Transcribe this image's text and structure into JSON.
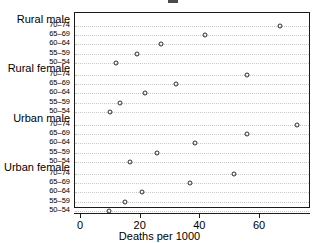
{
  "chart_data": {
    "type": "scatter",
    "plot_style": "cleveland-dot-plot",
    "title": "",
    "xlabel": "Deaths per 1000",
    "ylabel": "",
    "xlim": [
      0,
      77
    ],
    "xticks": [
      0,
      20,
      40,
      60
    ],
    "xtick_labels": [
      "0",
      "20",
      "40",
      "60"
    ],
    "grid": "horizontal-dotted",
    "legend": "none",
    "marker": "open-circle",
    "group_order": [
      "Rural male",
      "Rural female",
      "Urban male",
      "Urban female"
    ],
    "age_bands": [
      "70–74",
      "65–69",
      "60–64",
      "55–59",
      "50–54"
    ],
    "groups": [
      {
        "name": "Rural male",
        "points": [
          {
            "age": "70–74",
            "value": 66.7
          },
          {
            "age": "65–69",
            "value": 41.6
          },
          {
            "age": "60–64",
            "value": 26.8
          },
          {
            "age": "55–59",
            "value": 18.7
          },
          {
            "age": "50–54",
            "value": 11.6
          }
        ]
      },
      {
        "name": "Rural female",
        "points": [
          {
            "age": "70–74",
            "value": 55.6
          },
          {
            "age": "65–69",
            "value": 31.9
          },
          {
            "age": "60–64",
            "value": 21.5
          },
          {
            "age": "55–59",
            "value": 13.1
          },
          {
            "age": "50–54",
            "value": 9.8
          }
        ]
      },
      {
        "name": "Urban male",
        "points": [
          {
            "age": "70–74",
            "value": 72.4
          },
          {
            "age": "65–69",
            "value": 55.6
          },
          {
            "age": "60–64",
            "value": 38.2
          },
          {
            "age": "55–59",
            "value": 25.5
          },
          {
            "age": "50–54",
            "value": 16.4
          }
        ]
      },
      {
        "name": "Urban female",
        "points": [
          {
            "age": "70–74",
            "value": 51.3
          },
          {
            "age": "65–69",
            "value": 36.5
          },
          {
            "age": "60–64",
            "value": 20.5
          },
          {
            "age": "55–59",
            "value": 14.8
          },
          {
            "age": "50–54",
            "value": 9.4
          }
        ]
      }
    ],
    "colors": {
      "marker_stroke": "#2b2b2b",
      "frame": "#1a1a1a",
      "gridline": "#c9c9c9",
      "background": "#ffffff",
      "text": "#000000"
    }
  }
}
